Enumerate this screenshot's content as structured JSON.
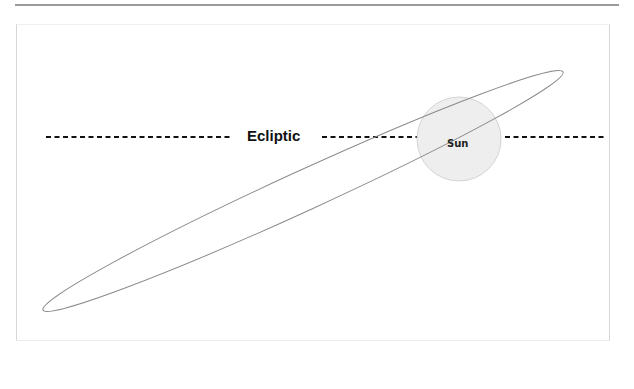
{
  "diagram": {
    "ecliptic_label": "Ecliptic",
    "sun_label": "Sun",
    "colors": {
      "orbit": "#8a8a8a",
      "sun_fill": "#eeeeee",
      "sun_stroke": "#d4d4d4",
      "ecliptic_line": "#111111"
    }
  }
}
